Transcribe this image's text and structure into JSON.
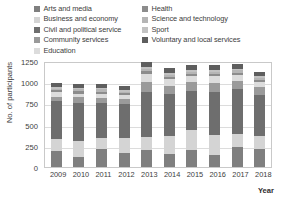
{
  "chart_data": {
    "type": "bar",
    "subtype": "stacked-bar",
    "title": "",
    "xlabel": "Year",
    "ylabel": "No. of participants",
    "categories": [
      "2009",
      "2010",
      "2011",
      "2012",
      "2013",
      "2014",
      "2015",
      "2016",
      "2017",
      "2018"
    ],
    "ylim": [
      0,
      1250
    ],
    "yticks": [
      0,
      250,
      500,
      750,
      1000,
      1250
    ],
    "ytick_labels": [
      "0",
      "250",
      "500",
      "750",
      "1000",
      "1250"
    ],
    "grid": true,
    "legend_position": "top",
    "series": [
      {
        "name": "Arts and media",
        "color": "#7f7f7f",
        "values": [
          190,
          120,
          210,
          165,
          200,
          150,
          205,
          145,
          235,
          210
        ]
      },
      {
        "name": "Business and economy",
        "color": "#d4d4d4",
        "values": [
          145,
          190,
          135,
          180,
          155,
          220,
          230,
          235,
          150,
          160
        ]
      },
      {
        "name": "Civil and political service",
        "color": "#6e6e6e",
        "values": [
          440,
          450,
          410,
          395,
          525,
          495,
          460,
          505,
          530,
          480
        ]
      },
      {
        "name": "Community services",
        "color": "#9a9a9a",
        "values": [
          55,
          60,
          55,
          60,
          120,
          95,
          105,
          110,
          100,
          90
        ]
      },
      {
        "name": "Education",
        "color": "#dcdcdc",
        "values": [
          50,
          45,
          50,
          45,
          95,
          75,
          70,
          75,
          70,
          60
        ]
      },
      {
        "name": "Health",
        "color": "#8c8c8c",
        "values": [
          25,
          30,
          30,
          25,
          35,
          30,
          30,
          30,
          30,
          30
        ]
      },
      {
        "name": "Science and technology",
        "color": "#b5b5b5",
        "values": [
          20,
          20,
          25,
          20,
          30,
          25,
          25,
          25,
          25,
          25
        ]
      },
      {
        "name": "Sport",
        "color": "#c2c2c2",
        "values": [
          15,
          15,
          15,
          15,
          20,
          20,
          20,
          20,
          20,
          20
        ]
      },
      {
        "name": "Voluntary and local services",
        "color": "#5e5e5e",
        "values": [
          55,
          50,
          55,
          50,
          55,
          55,
          55,
          55,
          55,
          50
        ]
      }
    ]
  },
  "legend": {
    "items": [
      {
        "label": "Arts and media",
        "color": "#7f7f7f"
      },
      {
        "label": "Health",
        "color": "#8c8c8c"
      },
      {
        "label": "Business and economy",
        "color": "#d4d4d4"
      },
      {
        "label": "Science and technology",
        "color": "#b5b5b5"
      },
      {
        "label": "Civil and political service",
        "color": "#6e6e6e"
      },
      {
        "label": "Sport",
        "color": "#c2c2c2"
      },
      {
        "label": "Community services",
        "color": "#9a9a9a"
      },
      {
        "label": "Voluntary and local services",
        "color": "#5e5e5e"
      },
      {
        "label": "Education",
        "color": "#dcdcdc"
      }
    ]
  },
  "axes": {
    "y_title": "No. of participants",
    "x_title": "Year"
  }
}
